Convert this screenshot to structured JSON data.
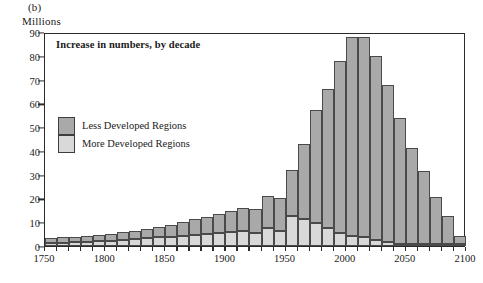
{
  "figure": {
    "panel_label": "(b)",
    "unit_label": "Millions",
    "title": "Increase in numbers, by decade"
  },
  "legend": {
    "items": [
      {
        "label": "Less Developed Regions",
        "color": "#a9a9a9"
      },
      {
        "label": "More Developed Regions",
        "color": "#d9d9d9"
      }
    ]
  },
  "chart_data": {
    "type": "bar",
    "title": "Increase in numbers, by decade",
    "xlabel": "",
    "ylabel": "Millions",
    "xlim": [
      1750,
      2100
    ],
    "ylim": [
      0,
      90
    ],
    "grid": false,
    "stacked": true,
    "legend_position": "inside-left",
    "x_tick_labels": [
      "1750",
      "1800",
      "1850",
      "1900",
      "1950",
      "2000",
      "2050",
      "2100"
    ],
    "y_tick_labels": [
      "0",
      "10",
      "20",
      "30",
      "40",
      "50",
      "60",
      "70",
      "80",
      "90"
    ],
    "categories": [
      "1750",
      "1760",
      "1770",
      "1780",
      "1790",
      "1800",
      "1810",
      "1820",
      "1830",
      "1840",
      "1850",
      "1860",
      "1870",
      "1880",
      "1890",
      "1900",
      "1910",
      "1920",
      "1930",
      "1940",
      "1950",
      "1960",
      "1970",
      "1980",
      "1990",
      "2000",
      "2010",
      "2020",
      "2030",
      "2040",
      "2050",
      "2060",
      "2070",
      "2080",
      "2090"
    ],
    "series": [
      {
        "name": "More Developed Regions",
        "color": "#d9d9d9",
        "values": [
          1.2,
          1.4,
          1.6,
          1.8,
          2.0,
          2.2,
          2.5,
          2.8,
          3.2,
          3.6,
          4.0,
          4.4,
          4.8,
          5.2,
          5.6,
          6.0,
          6.2,
          5.4,
          7.6,
          6.2,
          12.5,
          11.5,
          9.6,
          7.6,
          5.6,
          4.2,
          3.6,
          2.6,
          1.6,
          0.8,
          0.4,
          0.2,
          0.2,
          0.2,
          0.2
        ]
      },
      {
        "name": "Less Developed Regions",
        "color": "#a9a9a9",
        "values": [
          2.0,
          2.2,
          2.4,
          2.6,
          2.8,
          3.0,
          3.3,
          3.6,
          4.0,
          4.4,
          5.0,
          5.6,
          6.4,
          7.2,
          8.0,
          8.8,
          9.8,
          10.0,
          13.4,
          14.2,
          19.5,
          31.5,
          47.4,
          58.4,
          72.4,
          83.8,
          84.4,
          77.4,
          66.0,
          53.0,
          40.6,
          30.8,
          19.8,
          11.8,
          3.6
        ]
      }
    ],
    "totals": [
      3.2,
      3.6,
      4.0,
      4.4,
      4.8,
      5.2,
      5.8,
      6.4,
      7.2,
      8.0,
      9.0,
      10.0,
      11.2,
      12.4,
      13.6,
      14.8,
      16.0,
      15.4,
      21.0,
      20.4,
      32.0,
      43.0,
      57.0,
      66.0,
      78.0,
      88.0,
      88.0,
      80.0,
      67.6,
      53.8,
      41.0,
      31.0,
      20.0,
      12.0,
      3.8
    ]
  }
}
